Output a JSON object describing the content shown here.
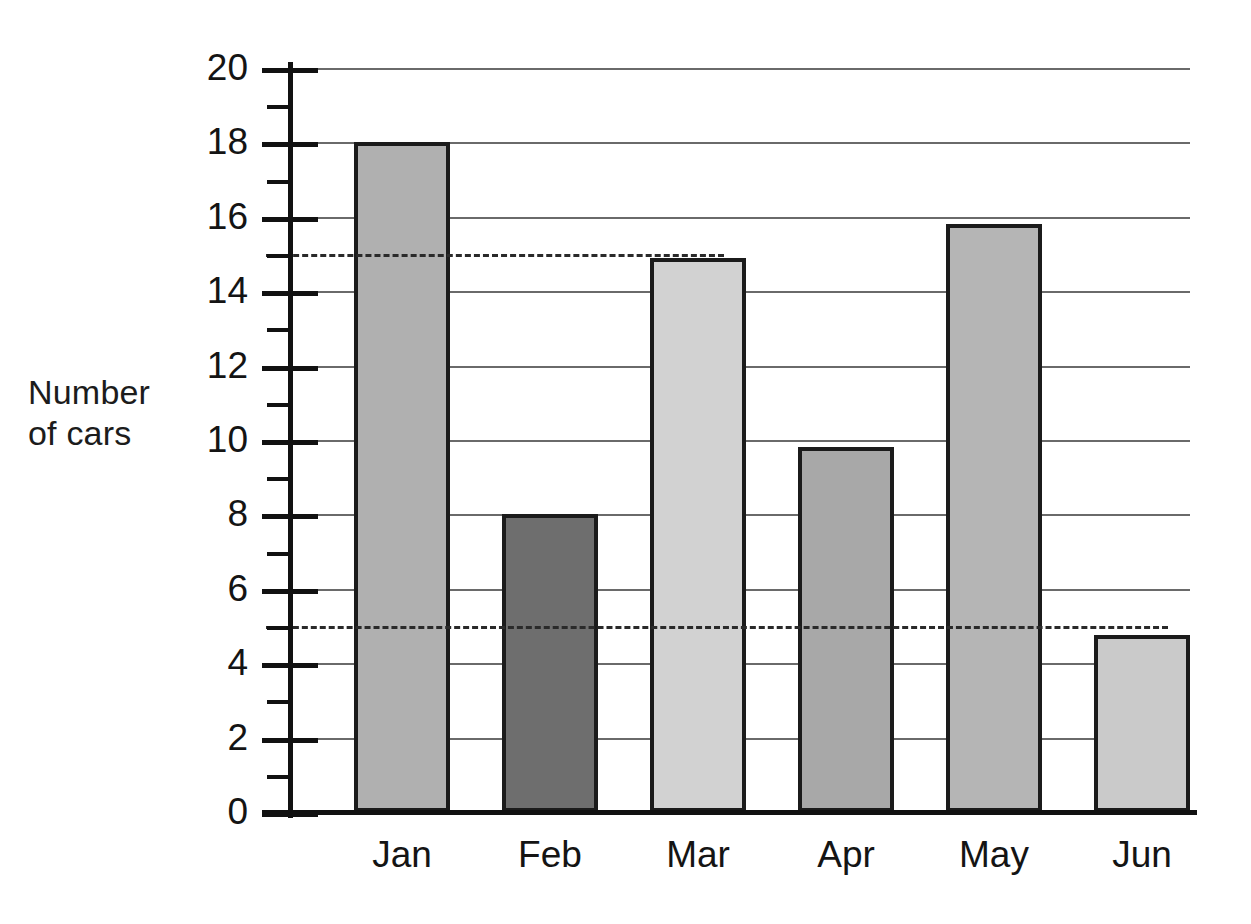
{
  "chart_data": {
    "type": "bar",
    "title": "",
    "xlabel": "",
    "ylabel": "Number of cars",
    "ylabel_lines": [
      "Number",
      "of cars"
    ],
    "categories": [
      "Jan",
      "Feb",
      "Mar",
      "Apr",
      "May",
      "Jun"
    ],
    "values": [
      18,
      8,
      14.9,
      9.8,
      15.8,
      4.75
    ],
    "bar_colors": [
      "#b0b0b0",
      "#6e6e6e",
      "#d2d2d2",
      "#a8a8a8",
      "#b5b5b5",
      "#cacaca"
    ],
    "bar_edge_color": "#1b1b1b",
    "ylim": [
      0,
      20
    ],
    "y_major_ticks": [
      0,
      2,
      4,
      6,
      8,
      10,
      12,
      14,
      16,
      18,
      20
    ],
    "y_minor_ticks": [
      1,
      3,
      5,
      7,
      9,
      11,
      13,
      15,
      17,
      19
    ],
    "y_tick_labels": [
      "0",
      "2",
      "4",
      "6",
      "8",
      "10",
      "12",
      "14",
      "16",
      "18",
      "20"
    ],
    "grid": true,
    "gridline_values": [
      2,
      4,
      6,
      8,
      10,
      12,
      14,
      16,
      18,
      20
    ],
    "gridline_color": "#6a6a6a",
    "legend": "none",
    "annotations": [
      {
        "type": "dashed-reference-line",
        "y": 15,
        "extends_to_category": "Mar"
      },
      {
        "type": "dashed-reference-line",
        "y": 5,
        "extends_to_category": "Jun"
      }
    ]
  }
}
